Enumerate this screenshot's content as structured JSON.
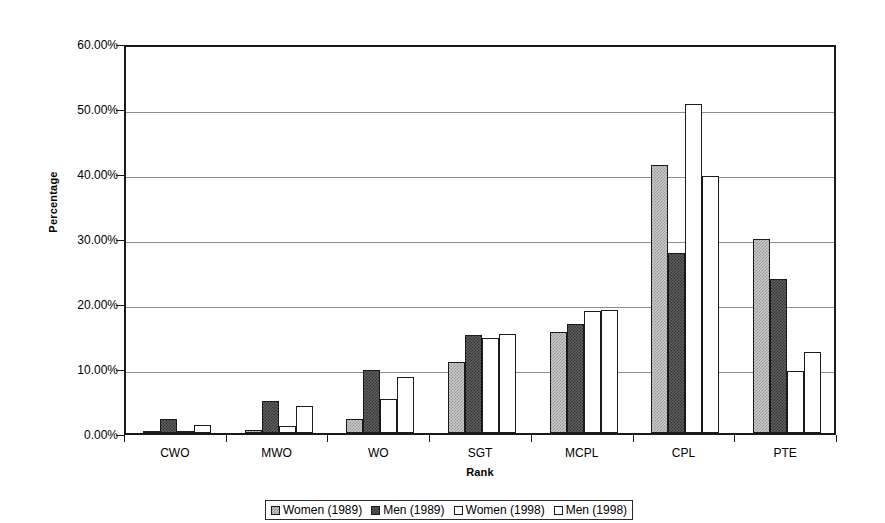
{
  "chart_data": {
    "type": "bar",
    "title": "",
    "xlabel": "Rank",
    "ylabel": "Percentage",
    "categories": [
      "CWO",
      "MWO",
      "WO",
      "SGT",
      "MCPL",
      "CPL",
      "PTE"
    ],
    "ylim": [
      0,
      60
    ],
    "y_ticks": [
      0,
      10,
      20,
      30,
      40,
      50,
      60
    ],
    "y_tick_labels": [
      "0.00%",
      "10.00%",
      "20.00%",
      "30.00%",
      "40.00%",
      "50.00%",
      "60.00%"
    ],
    "grid": true,
    "legend_position": "bottom",
    "series": [
      {
        "name": "Women (1989)",
        "fill": "#c9c9c9",
        "pattern": "light-dotted",
        "values": [
          0.1,
          0.4,
          2.2,
          10.9,
          15.6,
          41.2,
          29.8
        ]
      },
      {
        "name": "Men (1989)",
        "fill": "#5e5e5e",
        "pattern": "dark-dotted",
        "values": [
          2.2,
          4.9,
          9.7,
          15.1,
          16.8,
          27.7,
          23.7
        ]
      },
      {
        "name": "Women (1998)",
        "fill": "#ffffff",
        "pattern": "solid-outline",
        "values": [
          0.05,
          1.1,
          5.3,
          14.6,
          18.7,
          50.6,
          9.5
        ]
      },
      {
        "name": "Men (1998)",
        "fill": "#ffffff",
        "pattern": "solid-outline",
        "values": [
          1.3,
          4.1,
          8.6,
          15.2,
          18.9,
          39.6,
          12.4
        ]
      }
    ]
  },
  "legend": {
    "items": [
      {
        "label": "Women (1989)"
      },
      {
        "label": "Men (1989)"
      },
      {
        "label": "Women (1998)"
      },
      {
        "label": "Men (1998)"
      }
    ]
  },
  "axes": {
    "y_title": "Percentage",
    "x_title": "Rank"
  },
  "colors": {
    "axis": "#1a1a1a",
    "gridline": "#8f8f8f",
    "plot_background": "#ffffff",
    "series_1": "#c9c9c9",
    "series_2": "#5e5e5e",
    "series_3": "#ffffff",
    "series_4": "#ffffff"
  }
}
